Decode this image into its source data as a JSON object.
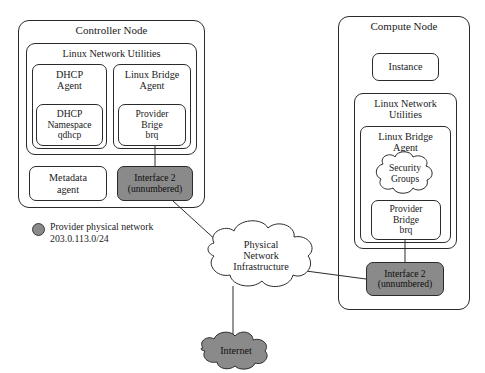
{
  "diagram": {
    "title_fragment": "",
    "colors": {
      "interface_fill": "#8a8a8a",
      "internet_fill": "#8a8a8a",
      "legend_swatch": "#8a8a8a",
      "stroke": "#2b2b2b",
      "background": "#ffffff"
    }
  },
  "controller_node": {
    "title": "Controller Node",
    "network_utilities": {
      "title": "Linux Network Utilities",
      "dhcp_agent": {
        "title": "DHCP\nAgent",
        "namespace": "DHCP\nNamespace\nqdhcp"
      },
      "linux_bridge_agent": {
        "title": "Linux Bridge\nAgent",
        "provider_bridge": "Provider\nBrige\nbrq"
      }
    },
    "metadata_agent": "Metadata\nagent",
    "interface": "Interface 2\n(unnumbered)"
  },
  "compute_node": {
    "title": "Compute Node",
    "instance": "Instance",
    "network_utilities": {
      "title": "Linux Network\nUtilities",
      "linux_bridge_agent": {
        "title": "Linux Bridge\nAgent",
        "security_groups": "Security\nGroups",
        "provider_bridge": "Provider\nBridge\nbrq"
      }
    },
    "interface": "Interface 2\n(unnumbered)"
  },
  "physical_network": {
    "label": "Physical\nNetwork\nInfrastructure"
  },
  "internet": {
    "label": "Internet"
  },
  "legend": {
    "label": "Provider physical network\n203.0.113.0/24"
  }
}
